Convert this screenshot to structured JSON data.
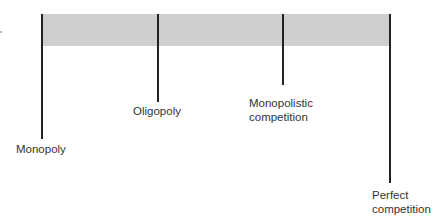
{
  "diagram": {
    "title": "",
    "spectrum_bar_color": "#cfcfcf",
    "markers": [
      {
        "label_line1": "Monopoly",
        "label_line2": ""
      },
      {
        "label_line1": "Oligopoly",
        "label_line2": ""
      },
      {
        "label_line1": "Monopolistic",
        "label_line2": "competition"
      },
      {
        "label_line1": "Perfect",
        "label_line2": "competition"
      }
    ]
  }
}
